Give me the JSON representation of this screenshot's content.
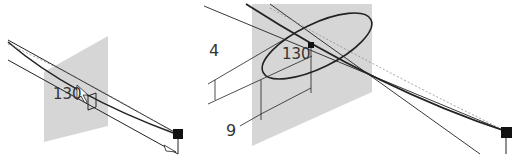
{
  "left_view": {
    "angle_label": "130"
  },
  "right_view": {
    "angle_label": "130",
    "height_label": "4",
    "width_label": "9"
  },
  "colors": {
    "plane": "#c8c8c8",
    "line": "#222222",
    "dashed": "#888888",
    "endpoint": "#111111"
  }
}
